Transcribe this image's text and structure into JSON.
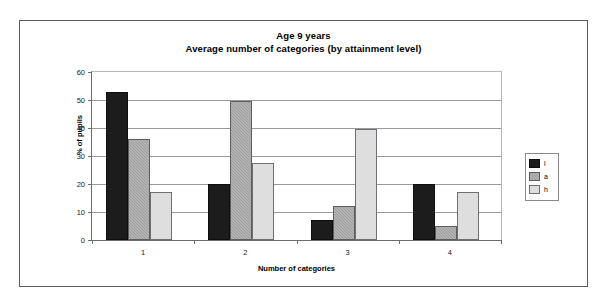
{
  "chart_data": {
    "type": "bar",
    "title": "Age 9 years\nAverage number of categories (by attainment level)",
    "title_line1": "Age 9 years",
    "title_line2": "Average number of categories (by attainment level)",
    "xlabel": "Number of categories",
    "ylabel": "% of pupils",
    "categories": [
      "1",
      "2",
      "3",
      "4"
    ],
    "ylim": [
      0,
      60
    ],
    "yticks": [
      0,
      10,
      20,
      30,
      40,
      50,
      60
    ],
    "ytick_labels": [
      "0",
      "10",
      "20",
      "30",
      "40",
      "50",
      "60"
    ],
    "grid": true,
    "grid_axis": "y",
    "legend_position": "right",
    "series": [
      {
        "name": "l",
        "label": "l",
        "color": "#1c1c1c",
        "values": [
          53,
          20,
          7,
          20
        ]
      },
      {
        "name": "a",
        "label": "a",
        "color": "#9d9d9d",
        "values": [
          36,
          49.5,
          12,
          5
        ]
      },
      {
        "name": "h",
        "label": "h",
        "color": "#dedede",
        "values": [
          17,
          27.5,
          39.5,
          17
        ]
      }
    ]
  },
  "legend": {
    "entries": [
      {
        "label": "l",
        "swatch": "black-swatch"
      },
      {
        "label": "a",
        "swatch": "gray-swatch"
      },
      {
        "label": "h",
        "swatch": "light-gray-swatch"
      }
    ]
  },
  "colors": {
    "series_l": "#1c1c1c",
    "series_a": "#9d9d9d",
    "series_h": "#dedede",
    "gridline": "#9a9a9e",
    "axis": "#6c6c70",
    "frame": "#59595e",
    "background": "#ffffff"
  }
}
